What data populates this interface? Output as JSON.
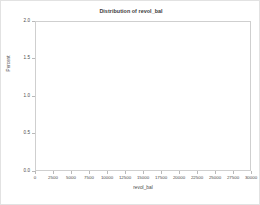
{
  "chart_data": {
    "type": "bar",
    "title": "Distribution of revol_bal",
    "xlabel": "revol_bal",
    "ylabel": "Percent",
    "xlim": [
      0,
      30000
    ],
    "ylim": [
      0.0,
      2.0
    ],
    "grid": false,
    "legend": null,
    "bin_width": 250,
    "xticks": [
      0,
      2500,
      5000,
      7500,
      10000,
      12500,
      15000,
      17500,
      20000,
      22500,
      25000,
      27500,
      30000
    ],
    "xtick_labels": [
      "0",
      "2500",
      "5000",
      "7500",
      "10000",
      "12500",
      "15000",
      "17500",
      "20000",
      "22500",
      "25000",
      "27500",
      "30000"
    ],
    "yticks": [
      0.0,
      0.5,
      1.0,
      1.5,
      2.0
    ],
    "ytick_labels": [
      "0.0",
      "0.5",
      "1.0",
      "1.5",
      "2.0"
    ],
    "bar_color": "#b6b6b6",
    "bar_edge_color": "#ffffff",
    "frame_color": "#cfcfcf",
    "text_color": "#4a4a4a",
    "x": [
      125,
      375,
      625,
      875,
      1125,
      1375,
      1625,
      1875,
      2125,
      2375,
      2625,
      2875,
      3125,
      3375,
      3625,
      3875,
      4125,
      4375,
      4625,
      4875,
      5125,
      5375,
      5625,
      5875,
      6125,
      6375,
      6625,
      6875,
      7125,
      7375,
      7625,
      7875,
      8125,
      8375,
      8625,
      8875,
      9125,
      9375,
      9625,
      9875,
      10125,
      10375,
      10625,
      10875,
      11125,
      11375,
      11625,
      11875,
      12125,
      12375,
      12625,
      12875,
      13125,
      13375,
      13625,
      13875,
      14125,
      14375,
      14625,
      14875,
      15125,
      15375,
      15625,
      15875,
      16125,
      16375,
      16625,
      16875,
      17125,
      17375,
      17625,
      17875,
      18125,
      18375,
      18625,
      18875,
      19125,
      19375,
      19625,
      19875,
      20125,
      20375,
      20625,
      20875,
      21125,
      21375,
      21625,
      21875,
      22125,
      22375,
      22625,
      22875,
      23125,
      23375,
      23625,
      23875,
      24125,
      24375,
      24625,
      24875,
      25125,
      25375,
      25625,
      25875,
      26125,
      26375,
      26625,
      26875,
      27125,
      27375,
      27625,
      27875,
      28125,
      28375,
      28625,
      28875,
      29125,
      29375,
      29625,
      29875
    ],
    "values": [
      0.92,
      0.93,
      0.97,
      1.0,
      1.02,
      1.05,
      1.1,
      1.13,
      1.17,
      1.2,
      1.24,
      1.28,
      1.31,
      1.35,
      1.38,
      1.42,
      1.45,
      1.48,
      1.52,
      1.55,
      1.58,
      1.62,
      1.66,
      1.7,
      1.73,
      1.76,
      1.78,
      1.8,
      1.79,
      1.78,
      1.77,
      1.76,
      1.75,
      1.74,
      1.73,
      1.72,
      1.71,
      1.7,
      1.68,
      1.67,
      1.65,
      1.63,
      1.61,
      1.6,
      1.58,
      1.56,
      1.54,
      1.52,
      1.5,
      1.49,
      1.47,
      1.45,
      1.43,
      1.42,
      1.4,
      1.38,
      1.36,
      1.35,
      1.33,
      1.31,
      1.29,
      1.27,
      1.26,
      1.24,
      1.22,
      1.2,
      1.18,
      1.17,
      1.15,
      1.13,
      1.12,
      1.1,
      1.08,
      1.06,
      1.05,
      1.03,
      1.01,
      1.0,
      0.98,
      0.96,
      0.94,
      0.92,
      0.9,
      0.89,
      0.87,
      0.85,
      0.84,
      0.82,
      0.81,
      0.79,
      0.78,
      0.76,
      0.75,
      0.73,
      0.72,
      0.7,
      0.69,
      0.67,
      0.66,
      0.64,
      0.63,
      0.62,
      0.6,
      0.59,
      0.57,
      0.56,
      0.55,
      0.53,
      0.52,
      0.5,
      0.49,
      0.47,
      0.46,
      0.44,
      0.43,
      0.41,
      0.4,
      0.38,
      0.35,
      0.3
    ]
  }
}
